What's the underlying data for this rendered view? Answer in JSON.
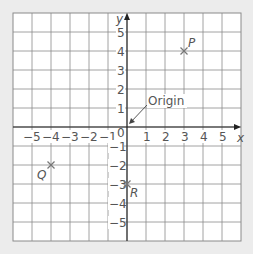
{
  "diagram": {
    "type": "coordinate-grid",
    "x_axis": {
      "label": "x",
      "min": -6,
      "max": 6,
      "tick_labels": [
        "−5",
        "−4",
        "−3",
        "−2",
        "−1",
        "1",
        "2",
        "3",
        "4",
        "5"
      ]
    },
    "y_axis": {
      "label": "y",
      "min": -6,
      "max": 6,
      "tick_labels": [
        "5",
        "4",
        "3",
        "2",
        "1",
        "−1",
        "−2",
        "−3",
        "−4",
        "−5"
      ]
    },
    "origin_label": "0",
    "annotation": {
      "text": "Origin",
      "points_to": [
        0,
        0
      ]
    },
    "points": [
      {
        "name": "P",
        "x": 3,
        "y": 4
      },
      {
        "name": "Q",
        "x": -4,
        "y": -2
      },
      {
        "name": "R",
        "x": 0,
        "y": -3
      }
    ],
    "colors": {
      "background": "#ececec",
      "grid_fill": "#ffffff",
      "grid_line": "#8a8a8a",
      "axis": "#222222",
      "text": "#555555",
      "marker": "#777777"
    }
  }
}
